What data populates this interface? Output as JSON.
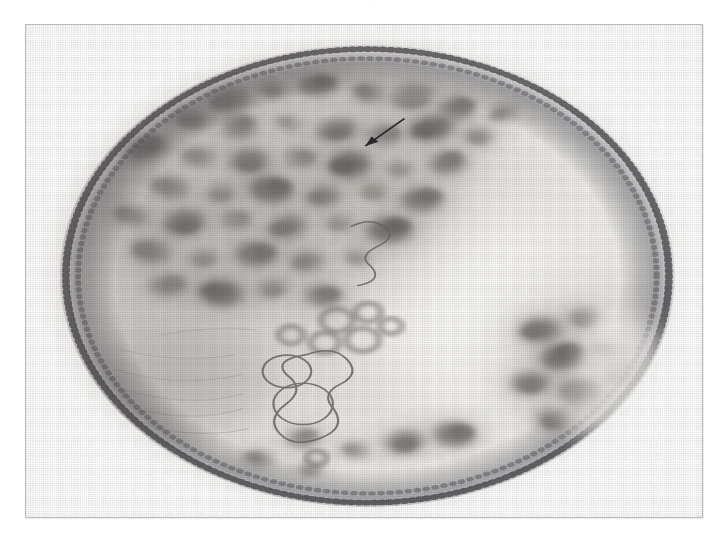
{
  "page": {
    "background_color": "#ffffff",
    "width": 725,
    "height": 539,
    "running_caption": "· · · · ·"
  },
  "plate": {
    "frame_color": "#b9babd",
    "frame_x": 25,
    "frame_y": 24,
    "frame_width": 678,
    "frame_height": 494,
    "background_color": "#ffffff",
    "caption": ""
  },
  "micrograph": {
    "name": "cell-nucleus-electron-micrograph",
    "description": "Halftone-screened transmission electron micrograph of a rounded cell nucleus showing dense heterochromatin clumps, a pale euchromatic region on the right, a large pale nucleolar body at lower left, ring-shaped vesicular profiles near the centre, and a dotted nuclear envelope at the perimeter.",
    "render_type": "halftone-dither-grayscale",
    "palette": {
      "paper": "#ffffff",
      "nucleoplasm_light": "#f2f1ef",
      "nucleoplasm_mid": "#dcdad6",
      "chromatin_mid": "#a9a7a3",
      "chromatin_dark": "#6f6e6c",
      "chromatin_darkest": "#3d3c3b",
      "envelope": "#55545a",
      "outline": "#6b6a68",
      "annotation": "#2a2a2c"
    },
    "body": {
      "center_x_pct": 50.5,
      "center_y_pct": 51.0,
      "radius_x_pct": 45.5,
      "radius_y_pct": 47.0
    },
    "regions": [
      {
        "name": "euchromatin-pale-zone",
        "cx_pct": 68,
        "cy_pct": 58,
        "rx_pct": 22,
        "ry_pct": 26,
        "tone": "#fbfbfa"
      },
      {
        "name": "nucleolus-pale-body",
        "cx_pct": 24,
        "cy_pct": 73,
        "rx_pct": 14,
        "ry_pct": 13,
        "tone": "#c9c7c2"
      },
      {
        "name": "dense-chromatin-field",
        "cx_pct": 33,
        "cy_pct": 33,
        "rx_pct": 30,
        "ry_pct": 26,
        "tone": "#cfcdc8"
      },
      {
        "name": "right-peripheral-clumps",
        "cx_pct": 83,
        "cy_pct": 68,
        "rx_pct": 13,
        "ry_pct": 17,
        "tone": "#cecbc6"
      }
    ],
    "chromatin_clumps": [
      {
        "cx": 30.2,
        "cy": 15.4,
        "rx": 3.1,
        "ry": 2.3,
        "rot": -18,
        "tone": "#8e8c88"
      },
      {
        "cx": 36.5,
        "cy": 13.1,
        "rx": 2.2,
        "ry": 1.7,
        "rot": 12,
        "tone": "#999793"
      },
      {
        "cx": 43.2,
        "cy": 12.3,
        "rx": 2.9,
        "ry": 2.1,
        "rot": -6,
        "tone": "#7c7a77"
      },
      {
        "cx": 50.6,
        "cy": 13.8,
        "rx": 2.3,
        "ry": 1.9,
        "rot": 22,
        "tone": "#86847f"
      },
      {
        "cx": 57.1,
        "cy": 14.6,
        "rx": 3.4,
        "ry": 2.5,
        "rot": -11,
        "tone": "#8d8b86"
      },
      {
        "cx": 63.8,
        "cy": 16.8,
        "rx": 2.6,
        "ry": 2.2,
        "rot": 8,
        "tone": "#7e7c79"
      },
      {
        "cx": 70.4,
        "cy": 18.0,
        "rx": 2.1,
        "ry": 1.6,
        "rot": -24,
        "tone": "#9a9894"
      },
      {
        "cx": 24.6,
        "cy": 19.2,
        "rx": 2.7,
        "ry": 2.0,
        "rot": 15,
        "tone": "#908e8a"
      },
      {
        "cx": 31.6,
        "cy": 20.6,
        "rx": 2.4,
        "ry": 2.3,
        "rot": -9,
        "tone": "#83817d"
      },
      {
        "cx": 38.8,
        "cy": 20.0,
        "rx": 2.0,
        "ry": 1.5,
        "rot": 30,
        "tone": "#9c9a96"
      },
      {
        "cx": 46.0,
        "cy": 21.4,
        "rx": 3.0,
        "ry": 2.1,
        "rot": -16,
        "tone": "#7a7875"
      },
      {
        "cx": 53.0,
        "cy": 22.3,
        "rx": 2.5,
        "ry": 2.0,
        "rot": 5,
        "tone": "#8a8884"
      },
      {
        "cx": 60.0,
        "cy": 21.0,
        "rx": 3.3,
        "ry": 2.4,
        "rot": -20,
        "tone": "#6e6c6a"
      },
      {
        "cx": 66.9,
        "cy": 22.6,
        "rx": 2.2,
        "ry": 1.8,
        "rot": 18,
        "tone": "#95938f"
      },
      {
        "cx": 17.9,
        "cy": 25.2,
        "rx": 3.2,
        "ry": 2.2,
        "rot": -28,
        "tone": "#85837f"
      },
      {
        "cx": 25.4,
        "cy": 26.8,
        "rx": 2.4,
        "ry": 2.0,
        "rot": 10,
        "tone": "#908e89"
      },
      {
        "cx": 33.0,
        "cy": 27.6,
        "rx": 2.8,
        "ry": 2.4,
        "rot": -5,
        "tone": "#7b7976"
      },
      {
        "cx": 40.6,
        "cy": 27.0,
        "rx": 2.3,
        "ry": 1.9,
        "rot": 24,
        "tone": "#8d8b87"
      },
      {
        "cx": 47.8,
        "cy": 28.4,
        "rx": 3.1,
        "ry": 2.6,
        "rot": -13,
        "tone": "#6a6866"
      },
      {
        "cx": 55.2,
        "cy": 29.2,
        "rx": 2.0,
        "ry": 1.7,
        "rot": 7,
        "tone": "#9b9995"
      },
      {
        "cx": 62.4,
        "cy": 28.0,
        "rx": 2.7,
        "ry": 2.2,
        "rot": -21,
        "tone": "#7f7d7a"
      },
      {
        "cx": 21.2,
        "cy": 33.0,
        "rx": 2.9,
        "ry": 2.1,
        "rot": 16,
        "tone": "#888682"
      },
      {
        "cx": 28.8,
        "cy": 34.2,
        "rx": 2.2,
        "ry": 1.9,
        "rot": -8,
        "tone": "#939190"
      },
      {
        "cx": 36.2,
        "cy": 33.4,
        "rx": 3.2,
        "ry": 2.6,
        "rot": 11,
        "tone": "#6f6d6b"
      },
      {
        "cx": 44.0,
        "cy": 34.8,
        "rx": 2.5,
        "ry": 2.1,
        "rot": -17,
        "tone": "#848280"
      },
      {
        "cx": 51.4,
        "cy": 33.8,
        "rx": 2.1,
        "ry": 1.8,
        "rot": 26,
        "tone": "#97958f"
      },
      {
        "cx": 58.6,
        "cy": 35.4,
        "rx": 3.0,
        "ry": 2.3,
        "rot": -4,
        "tone": "#787674"
      },
      {
        "cx": 15.6,
        "cy": 38.8,
        "rx": 2.6,
        "ry": 2.0,
        "rot": 20,
        "tone": "#8c8a86"
      },
      {
        "cx": 23.4,
        "cy": 40.2,
        "rx": 3.1,
        "ry": 2.5,
        "rot": -14,
        "tone": "#747270"
      },
      {
        "cx": 31.0,
        "cy": 39.6,
        "rx": 2.3,
        "ry": 1.9,
        "rot": 9,
        "tone": "#918f8b"
      },
      {
        "cx": 38.6,
        "cy": 41.0,
        "rx": 2.8,
        "ry": 2.2,
        "rot": -23,
        "tone": "#7d7b78"
      },
      {
        "cx": 46.2,
        "cy": 40.2,
        "rx": 2.1,
        "ry": 1.7,
        "rot": 13,
        "tone": "#9a9894"
      },
      {
        "cx": 53.8,
        "cy": 41.6,
        "rx": 3.3,
        "ry": 2.5,
        "rot": -9,
        "tone": "#6c6a68"
      },
      {
        "cx": 18.4,
        "cy": 46.0,
        "rx": 2.9,
        "ry": 2.3,
        "rot": 18,
        "tone": "#838180"
      },
      {
        "cx": 26.2,
        "cy": 47.4,
        "rx": 2.2,
        "ry": 1.8,
        "rot": -12,
        "tone": "#959391"
      },
      {
        "cx": 34.0,
        "cy": 46.6,
        "rx": 3.0,
        "ry": 2.4,
        "rot": 6,
        "tone": "#76746f"
      },
      {
        "cx": 41.6,
        "cy": 48.0,
        "rx": 2.4,
        "ry": 2.0,
        "rot": -19,
        "tone": "#8a8885"
      },
      {
        "cx": 49.0,
        "cy": 47.2,
        "rx": 2.0,
        "ry": 1.6,
        "rot": 27,
        "tone": "#9d9b97"
      },
      {
        "cx": 21.0,
        "cy": 53.0,
        "rx": 2.7,
        "ry": 2.1,
        "rot": -7,
        "tone": "#888682"
      },
      {
        "cx": 28.8,
        "cy": 54.4,
        "rx": 3.2,
        "ry": 2.6,
        "rot": 14,
        "tone": "#706e6c"
      },
      {
        "cx": 36.4,
        "cy": 53.6,
        "rx": 2.3,
        "ry": 1.9,
        "rot": -25,
        "tone": "#92908c"
      },
      {
        "cx": 44.0,
        "cy": 55.0,
        "rx": 2.6,
        "ry": 2.1,
        "rot": 10,
        "tone": "#7e7c79"
      },
      {
        "cx": 76.0,
        "cy": 62.0,
        "rx": 3.0,
        "ry": 2.4,
        "rot": -15,
        "tone": "#7a7875"
      },
      {
        "cx": 82.6,
        "cy": 59.6,
        "rx": 2.4,
        "ry": 2.0,
        "rot": 8,
        "tone": "#8b8985"
      },
      {
        "cx": 79.4,
        "cy": 67.4,
        "rx": 3.3,
        "ry": 2.6,
        "rot": -20,
        "tone": "#6d6b69"
      },
      {
        "cx": 86.0,
        "cy": 66.0,
        "rx": 2.1,
        "ry": 1.8,
        "rot": 17,
        "tone": "#97958f"
      },
      {
        "cx": 74.6,
        "cy": 72.8,
        "rx": 2.8,
        "ry": 2.2,
        "rot": -6,
        "tone": "#817f7c"
      },
      {
        "cx": 82.0,
        "cy": 74.6,
        "rx": 3.1,
        "ry": 2.5,
        "rot": 12,
        "tone": "#73716f"
      },
      {
        "cx": 88.0,
        "cy": 71.0,
        "rx": 2.2,
        "ry": 1.7,
        "rot": -28,
        "tone": "#959390"
      },
      {
        "cx": 78.0,
        "cy": 80.2,
        "rx": 2.6,
        "ry": 2.0,
        "rot": 21,
        "tone": "#86847f"
      },
      {
        "cx": 41.0,
        "cy": 84.0,
        "rx": 2.3,
        "ry": 1.9,
        "rot": -10,
        "tone": "#8d8b87"
      },
      {
        "cx": 48.6,
        "cy": 86.4,
        "rx": 2.0,
        "ry": 1.6,
        "rot": 15,
        "tone": "#9a9894"
      },
      {
        "cx": 56.0,
        "cy": 84.8,
        "rx": 2.8,
        "ry": 2.2,
        "rot": -18,
        "tone": "#7c7a77"
      },
      {
        "cx": 63.4,
        "cy": 83.2,
        "rx": 3.0,
        "ry": 2.4,
        "rot": 7,
        "tone": "#767470"
      },
      {
        "cx": 34.4,
        "cy": 88.0,
        "rx": 2.1,
        "ry": 1.7,
        "rot": 24,
        "tone": "#999793"
      },
      {
        "cx": 42.0,
        "cy": 90.2,
        "rx": 1.8,
        "ry": 1.5,
        "rot": -9,
        "tone": "#a2a09c"
      }
    ],
    "vesicle_rings": [
      {
        "cx": 46.0,
        "cy": 60.0,
        "r": 2.3
      },
      {
        "cx": 50.6,
        "cy": 58.4,
        "r": 1.9
      },
      {
        "cx": 44.2,
        "cy": 64.6,
        "r": 2.1
      },
      {
        "cx": 49.8,
        "cy": 64.0,
        "r": 2.4
      },
      {
        "cx": 54.0,
        "cy": 61.2,
        "r": 1.6
      },
      {
        "cx": 39.2,
        "cy": 63.0,
        "r": 1.8
      },
      {
        "cx": 43.0,
        "cy": 88.0,
        "r": 1.5
      }
    ],
    "outlined_bodies": [
      {
        "name": "nucleolar-vacuole",
        "cx": 38.6,
        "cy": 70.4,
        "rx": 3.6,
        "ry": 3.3
      },
      {
        "name": "irregular-membrane-loop",
        "cx": 41.0,
        "cy": 77.0,
        "rx": 4.4,
        "ry": 4.2
      }
    ],
    "annotation": {
      "type": "arrow",
      "name": "feature-arrow",
      "x1_pct": 56.0,
      "y1_pct": 19.0,
      "x2_pct": 50.2,
      "y2_pct": 24.6,
      "color": "#2a2a2c",
      "label": ""
    },
    "envelope": {
      "name": "nuclear-envelope",
      "style": "dotted-dense-perimeter",
      "color": "#4b4a4e"
    }
  }
}
